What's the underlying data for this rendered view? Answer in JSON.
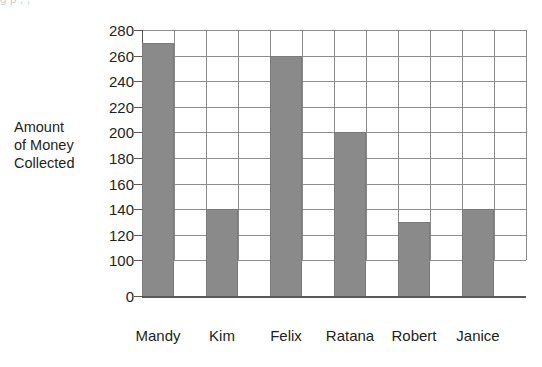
{
  "clipped_title": "g p                                                                        ,                              ,",
  "axis": {
    "y_title_lines": [
      "Amount",
      "of Money",
      "Collected"
    ],
    "y_ticks": [
      280,
      260,
      240,
      220,
      200,
      180,
      160,
      140,
      120,
      100,
      0
    ],
    "y_tick_labels": [
      "280",
      "260",
      "240",
      "220",
      "200",
      "180",
      "160",
      "140",
      "120",
      "100",
      "0"
    ]
  },
  "colors": {
    "bar_fill": "#8a8a8a",
    "bar_stroke": "#7a7a7a",
    "gridline": "#8c8c8c",
    "axis_line": "#595959",
    "text": "#231f20",
    "background": "#ffffff"
  },
  "chart_data": {
    "type": "bar",
    "title": "",
    "xlabel": "",
    "ylabel": "Amount of Money Collected",
    "categories": [
      "Mandy",
      "Kim",
      "Felix",
      "Ratana",
      "Robert",
      "Janice"
    ],
    "values": [
      270,
      140,
      260,
      200,
      130,
      140
    ],
    "ylim": [
      0,
      280
    ],
    "y_ticks": [
      0,
      100,
      120,
      140,
      160,
      180,
      200,
      220,
      240,
      260,
      280
    ],
    "y_axis_break": true,
    "grid": true,
    "legend": "none",
    "vertical_gridline_columns": 12
  }
}
